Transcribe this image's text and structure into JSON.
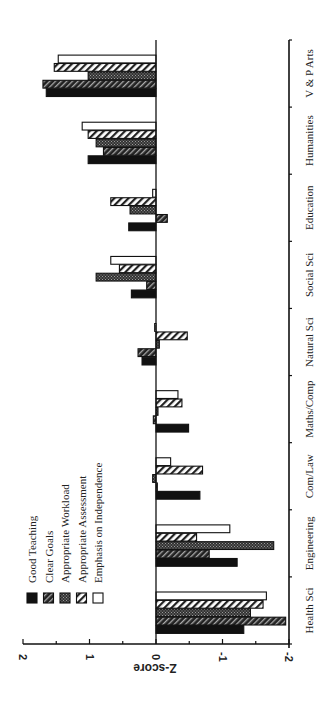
{
  "chart_data": {
    "type": "bar",
    "orientation": "horizontal bars, figure rotated 90 degrees (page viewed sideways)",
    "title": "",
    "xlabel": "",
    "ylabel": "Z-score",
    "ylim": [
      -2,
      2
    ],
    "y_ticks": [
      "2",
      "1",
      "0",
      "-1",
      "-2"
    ],
    "grid": false,
    "legend_position": "upper-left (in rotated view: lower-left)",
    "categories": [
      "Health Sci",
      "Engineering",
      "Com/Law",
      "Maths/Comp",
      "Natural Sci",
      "Social Sci",
      "Education",
      "Humanities",
      "V & P Arts"
    ],
    "series": [
      {
        "name": "Good Teaching",
        "pattern": "solid-black",
        "values": [
          -1.32,
          -1.22,
          -0.66,
          -0.49,
          0.21,
          0.37,
          0.41,
          1.02,
          1.65
        ]
      },
      {
        "name": "Clear Goals",
        "pattern": "dark-hatch",
        "values": [
          -1.95,
          -0.8,
          -0.02,
          0.04,
          0.27,
          0.14,
          -0.17,
          0.79,
          1.7
        ]
      },
      {
        "name": "Appropriate Workload",
        "pattern": "dark-stipple",
        "values": [
          -1.42,
          -1.77,
          0.05,
          -0.03,
          -0.05,
          0.9,
          0.39,
          0.9,
          1.02
        ]
      },
      {
        "name": "Appropriate Assessment",
        "pattern": "light-hatch",
        "values": [
          -1.61,
          -0.61,
          -0.7,
          -0.39,
          -0.47,
          0.55,
          0.68,
          1.02,
          1.53
        ]
      },
      {
        "name": "Emphasis on Independence",
        "pattern": "white",
        "values": [
          -1.66,
          -1.11,
          -0.22,
          -0.33,
          0.02,
          0.68,
          0.05,
          1.11,
          1.47
        ]
      }
    ]
  },
  "legend": {
    "items": [
      "Good Teaching",
      "Clear Goals",
      "Appropriate Workload",
      "Appropriate Assessment",
      "Emphasis on Independence"
    ]
  },
  "axis": {
    "title": "Z-score",
    "ticks": [
      "2",
      "1",
      "0",
      "-1",
      "-2"
    ]
  }
}
